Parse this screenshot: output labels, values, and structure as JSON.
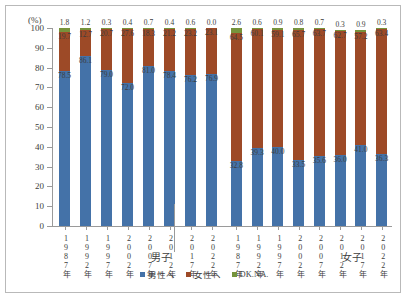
{
  "axis": {
    "unit_label": "(%)",
    "y_ticks": [
      "100",
      "90",
      "80",
      "70",
      "60",
      "50",
      "40",
      "30",
      "20",
      "10",
      "0"
    ],
    "y_min": 0,
    "y_max": 100
  },
  "groups": [
    {
      "name": "男子"
    },
    {
      "name": "女子"
    }
  ],
  "legend": [
    {
      "label": "男性へ",
      "color": "#4472a8",
      "name": "male"
    },
    {
      "label": "女性へ",
      "color": "#9d4a27",
      "name": "female"
    },
    {
      "label": "DK.NA.",
      "color": "#76933c",
      "name": "dknа"
    }
  ],
  "chart_data": {
    "type": "bar",
    "title": "",
    "subtitle": "",
    "xlabel": "",
    "ylabel": "(%)",
    "ylim": [
      0,
      100
    ],
    "grid": false,
    "stacked": true,
    "legend_position": "bottom",
    "categories": [
      "1987年",
      "1992年",
      "1997年",
      "2002年",
      "2007年",
      "2012年",
      "2017年",
      "2022年",
      "1987年",
      "1992年",
      "1997年",
      "2002年",
      "2007年",
      "2012年",
      "2017年",
      "2022年"
    ],
    "group_labels": [
      "男子",
      "女子"
    ],
    "group_split_index": 8,
    "series": [
      {
        "name": "男性へ",
        "color": "#4472a8",
        "values": [
          78.5,
          86.1,
          79.0,
          72.0,
          81.0,
          78.4,
          76.2,
          76.9,
          32.8,
          39.3,
          40.0,
          33.5,
          35.6,
          36.0,
          41.0,
          36.3
        ]
      },
      {
        "name": "女性へ",
        "color": "#9d4a27",
        "values": [
          19.7,
          12.7,
          20.7,
          27.6,
          18.3,
          21.2,
          23.2,
          23.1,
          64.5,
          60.1,
          59.1,
          65.7,
          63.7,
          62.7,
          57.2,
          63.4
        ]
      },
      {
        "name": "DK.NA.",
        "color": "#76933c",
        "values": [
          1.8,
          1.2,
          0.3,
          0.4,
          0.7,
          0.4,
          0.6,
          0.0,
          2.6,
          0.6,
          0.9,
          0.8,
          0.7,
          0.3,
          0.9,
          0.3
        ]
      }
    ]
  }
}
